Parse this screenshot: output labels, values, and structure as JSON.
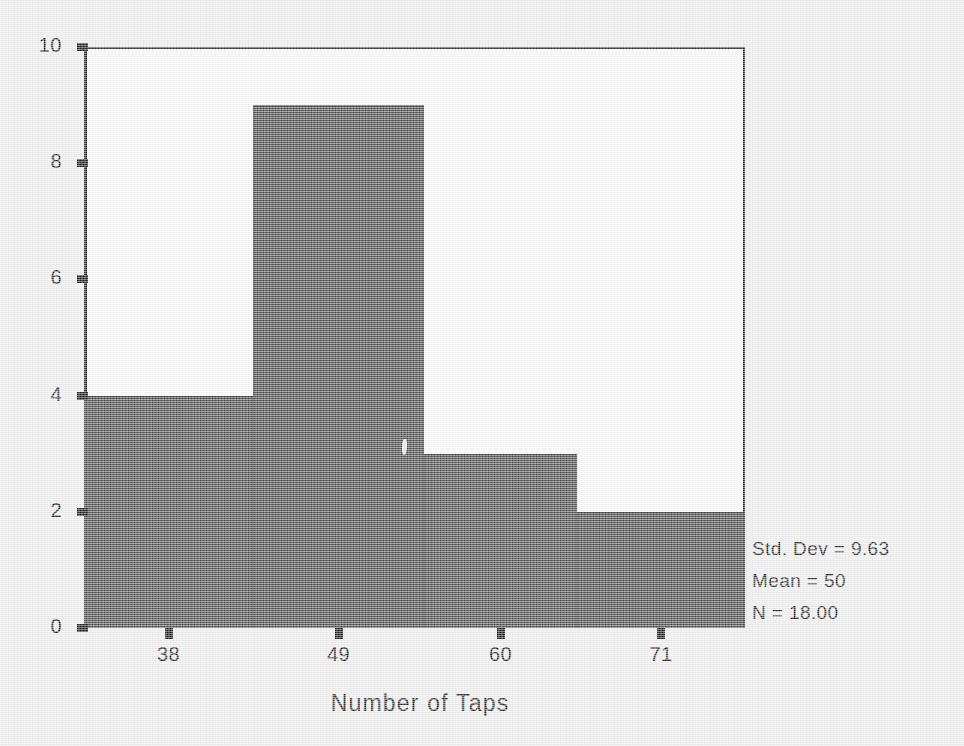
{
  "chart_data": {
    "type": "bar",
    "chart_style": "histogram",
    "title": "",
    "xlabel": "Number of Taps",
    "ylabel": "",
    "categories": [
      "38",
      "49",
      "60",
      "71"
    ],
    "values": [
      4,
      9,
      3,
      2
    ],
    "ylim": [
      0,
      10
    ],
    "y_ticks": [
      10,
      8,
      6,
      4,
      2,
      0
    ],
    "x_tick_labels": [
      "38",
      "49",
      "60",
      "71"
    ],
    "grid": false,
    "legend": false,
    "bar_color": "#4b4b4b",
    "plot_background": "#f6f6f6",
    "page_background": "#ececec",
    "axis_color": "#1c1c1c",
    "bin_edges_px": [
      84,
      253,
      424,
      577,
      745
    ],
    "annotations": [
      "Std. Dev = 9.63",
      "Mean = 50",
      "N = 18.00"
    ]
  },
  "axes": {
    "y": {
      "ticks": [
        {
          "label": "10",
          "value": 10
        },
        {
          "label": "8",
          "value": 8
        },
        {
          "label": "6",
          "value": 6
        },
        {
          "label": "4",
          "value": 4
        },
        {
          "label": "2",
          "value": 2
        },
        {
          "label": "0",
          "value": 0
        }
      ]
    },
    "x": {
      "ticks": [
        {
          "label": "38"
        },
        {
          "label": "49"
        },
        {
          "label": "60"
        },
        {
          "label": "71"
        }
      ],
      "title": "Number of Taps"
    }
  },
  "stats": {
    "std_dev": "Std. Dev = 9.63",
    "mean": "Mean = 50",
    "n": "N = 18.00"
  }
}
